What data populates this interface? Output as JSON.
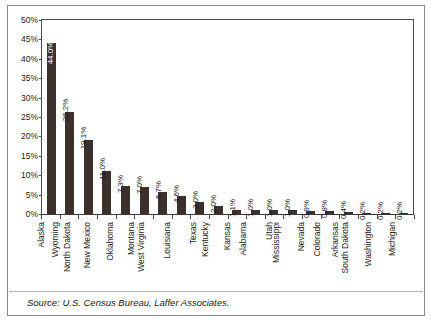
{
  "chart_data": {
    "type": "bar",
    "title": "",
    "xlabel": "",
    "ylabel": "",
    "ylim": [
      0,
      50
    ],
    "yticks": [
      "0%",
      "5%",
      "10%",
      "15%",
      "20%",
      "25%",
      "30%",
      "35%",
      "40%",
      "45%",
      "50%"
    ],
    "ytick_values": [
      0,
      5,
      10,
      15,
      20,
      25,
      30,
      35,
      40,
      45,
      50
    ],
    "grid": false,
    "legend": "none",
    "orientation": "vertical",
    "categories": [
      "Alaska",
      "Wyoming",
      "North Dakota",
      "New Mexico",
      "Oklahoma",
      "Montana",
      "West Virginia",
      "Louisiana",
      "Texas",
      "Kentucky",
      "Kansas",
      "Alabama",
      "Utah",
      "Mississippi",
      "Nevada",
      "Colorado",
      "Arkansas",
      "South Dakota",
      "Washington",
      "Michigan"
    ],
    "values": [
      44.0,
      26.2,
      19.1,
      11.0,
      7.3,
      7.0,
      5.7,
      4.6,
      3.0,
      2.0,
      1.1,
      1.0,
      1.0,
      1.0,
      0.9,
      0.8,
      0.4,
      0.2,
      0.2,
      0.2
    ],
    "data_labels": [
      "44.0%",
      "26.2%",
      "19.1%",
      "11.0%",
      "7.3%",
      "7.0%",
      "5.7%",
      "4.6%",
      "3.0%",
      "2.0%",
      "1.1%",
      "1.0%",
      "1.0%",
      "1.0%",
      "0.9%",
      "0.8%",
      "0.4%",
      "0.2%",
      "0.2%",
      "0.2%"
    ],
    "bar_color": "#3b302b",
    "inside_label_indices": [
      0
    ]
  },
  "footer": {
    "source": "Source: U.S. Census Bureau, Laffer Associates."
  }
}
